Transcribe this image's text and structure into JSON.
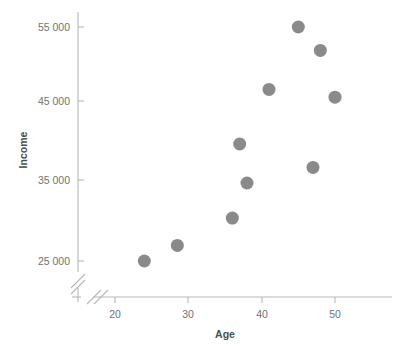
{
  "chart_data": {
    "type": "scatter",
    "title": "",
    "xlabel": "Age",
    "ylabel": "Income",
    "xlim": [
      15,
      57
    ],
    "ylim": [
      22000,
      58000
    ],
    "grid": false,
    "legend": "none",
    "axis_break_x": true,
    "axis_break_y": true,
    "marker_color": "#8a8a8a",
    "marker_size_px": 13,
    "axis_color": "#b4b8ba",
    "label_color": "#6e7375",
    "title_color": "#4a4f52",
    "xticks": [
      20,
      30,
      40,
      50
    ],
    "xtick_labels": [
      "20",
      "30",
      "40",
      "50"
    ],
    "yticks": [
      25000,
      35000,
      45000,
      55000
    ],
    "ytick_labels": [
      "25 000",
      "35 000",
      "45 000",
      "55 000"
    ],
    "series": [
      {
        "name": "observations",
        "points": [
          {
            "x": 24,
            "y": 25000
          },
          {
            "x": 28.5,
            "y": 27000
          },
          {
            "x": 36,
            "y": 30500
          },
          {
            "x": 37,
            "y": 40000
          },
          {
            "x": 38,
            "y": 35000
          },
          {
            "x": 41,
            "y": 47000
          },
          {
            "x": 45,
            "y": 55000
          },
          {
            "x": 47,
            "y": 37000
          },
          {
            "x": 48,
            "y": 52000
          },
          {
            "x": 50,
            "y": 46000
          }
        ]
      }
    ]
  },
  "axes": {
    "x_title": "Age",
    "y_title": "Income"
  }
}
